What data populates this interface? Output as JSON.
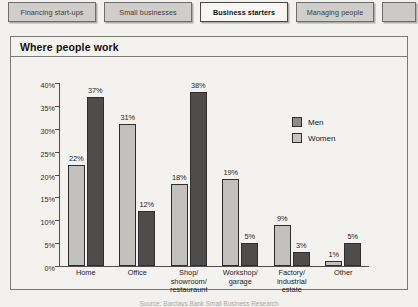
{
  "tabs": [
    {
      "label": "Financing start-ups",
      "active": false
    },
    {
      "label": "Small businesses",
      "active": false
    },
    {
      "label": "Business starters",
      "active": true
    },
    {
      "label": "Managing people",
      "active": false
    },
    {
      "label": "",
      "active": false
    }
  ],
  "panel": {
    "title": "Where people work"
  },
  "legend": {
    "men": "Men",
    "women": "Women"
  },
  "colors": {
    "men_bar": "#c2c1be",
    "women_bar": "#4e4d4b",
    "panel_background": "#f3f2ef",
    "axis": "#4f4f4f"
  },
  "chart_data": {
    "type": "bar",
    "title": "Where people work",
    "xlabel": "",
    "ylabel": "",
    "ylim": [
      0,
      40
    ],
    "ytick_labels": [
      "0%",
      "5%",
      "10%",
      "15%",
      "20%",
      "25%",
      "30%",
      "35%",
      "40%"
    ],
    "ytick_values": [
      0,
      5,
      10,
      15,
      20,
      25,
      30,
      35,
      40
    ],
    "grid": false,
    "legend_position": "upper-right",
    "categories": [
      "Home",
      "Office",
      "Shop/\nshowroom/\nrestauraunt",
      "Workshop/\ngarage",
      "Factory/\nindustrial\nestate",
      "Other"
    ],
    "series": [
      {
        "name": "Men",
        "values": [
          22,
          31,
          18,
          19,
          9,
          1
        ],
        "labels": [
          "22%",
          "31%",
          "18%",
          "19%",
          "9%",
          "1%"
        ]
      },
      {
        "name": "Women",
        "values": [
          37,
          12,
          38,
          5,
          3,
          5
        ],
        "labels": [
          "37%",
          "12%",
          "38%",
          "5%",
          "3%",
          "5%"
        ]
      }
    ]
  },
  "footnote": "Source: Barclays Bank Small Business Research"
}
